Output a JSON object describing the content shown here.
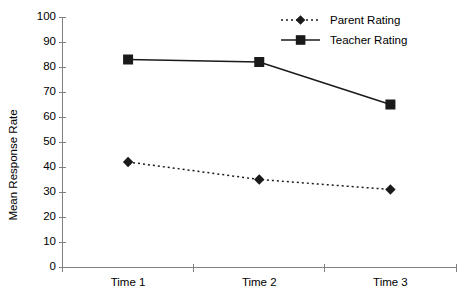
{
  "chart_data": {
    "type": "line",
    "title": "",
    "xlabel": "",
    "ylabel": "Mean Response Rate",
    "categories": [
      "Time 1",
      "Time 2",
      "Time 3"
    ],
    "ylim": [
      0,
      100
    ],
    "yticks": [
      0,
      10,
      20,
      30,
      40,
      50,
      60,
      70,
      80,
      90,
      100
    ],
    "ytick_labels": [
      "0",
      "10",
      "20",
      "30",
      "40",
      "50",
      "60",
      "70",
      "80",
      "90",
      "100"
    ],
    "grid": false,
    "legend_position": "top-right",
    "series": [
      {
        "name": "Parent Rating",
        "values": [
          42,
          35,
          31
        ],
        "line_style": "dotted",
        "marker": "diamond",
        "color": "#1a1a1a"
      },
      {
        "name": "Teacher Rating",
        "values": [
          83,
          82,
          65
        ],
        "line_style": "solid",
        "marker": "square",
        "color": "#1a1a1a"
      }
    ]
  },
  "axes": {
    "y_title": "Mean Response Rate"
  },
  "legend": {
    "entries": [
      {
        "label": "Parent Rating"
      },
      {
        "label": "Teacher Rating"
      }
    ]
  }
}
